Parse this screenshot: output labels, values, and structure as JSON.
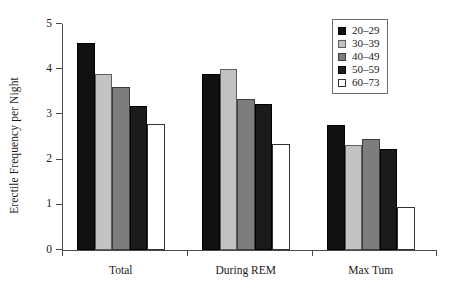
{
  "chart_data": {
    "type": "bar",
    "title": "",
    "xlabel": "",
    "ylabel": "Erectile Frequency per Night",
    "categories": [
      "Total",
      "During REM",
      "Max Tum"
    ],
    "ylim": [
      0,
      5
    ],
    "yticks": [
      0,
      1,
      2,
      3,
      4,
      5
    ],
    "ytick_labels": [
      "0",
      "1",
      "2",
      "3",
      "4",
      "5"
    ],
    "grid": false,
    "legend_position": "top-right",
    "series": [
      {
        "name": "20–29",
        "color": "#111111",
        "values": [
          4.58,
          3.89,
          2.76
        ]
      },
      {
        "name": "30–39",
        "color": "#c2c2c2",
        "values": [
          3.9,
          4.0,
          2.32
        ]
      },
      {
        "name": "40–49",
        "color": "#7d7d7d",
        "values": [
          3.6,
          3.33,
          2.46
        ]
      },
      {
        "name": "50–59",
        "color": "#1b1b1b",
        "values": [
          3.19,
          3.24,
          2.23
        ]
      },
      {
        "name": "60–73",
        "color": "#ffffff",
        "values": [
          2.78,
          2.35,
          0.95
        ]
      }
    ]
  }
}
